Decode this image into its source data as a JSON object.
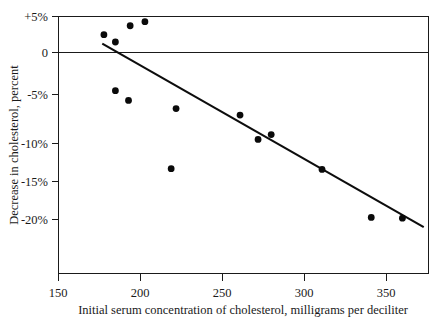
{
  "chart_data": {
    "type": "scatter",
    "title": "",
    "xlabel": "Initial serum concentration of cholesterol, milligrams per deciliter",
    "ylabel": "Decrease in cholesterol, percent",
    "xlim": [
      150,
      373
    ],
    "ylim": [
      -23.3,
      5.0
    ],
    "xticks": [
      150,
      200,
      250,
      300,
      350
    ],
    "xtick_labels": [
      "150",
      "200",
      "250",
      "300",
      "350"
    ],
    "yticks": [
      5,
      0,
      -5,
      -10,
      -15,
      -20
    ],
    "ytick_labels": [
      "+5%",
      "0",
      "-5%",
      "-10%",
      "-15%",
      "-20%"
    ],
    "grid": false,
    "legend": "none",
    "zero_reference_line": 0,
    "points": [
      {
        "x": 178,
        "y": 2.7
      },
      {
        "x": 185,
        "y": 1.8
      },
      {
        "x": 194,
        "y": 3.8
      },
      {
        "x": 203,
        "y": 4.3
      },
      {
        "x": 185,
        "y": -4.2
      },
      {
        "x": 193,
        "y": -5.4
      },
      {
        "x": 219,
        "y": -13.8
      },
      {
        "x": 222,
        "y": -6.4
      },
      {
        "x": 261,
        "y": -7.2
      },
      {
        "x": 272,
        "y": -10.2
      },
      {
        "x": 280,
        "y": -9.6
      },
      {
        "x": 311,
        "y": -13.9
      },
      {
        "x": 341,
        "y": -19.8
      },
      {
        "x": 360,
        "y": -19.9
      }
    ],
    "series": [
      {
        "name": "regression line",
        "type": "line",
        "x": [
          177,
          373
        ],
        "y": [
          1.6,
          -21.0
        ]
      }
    ]
  }
}
